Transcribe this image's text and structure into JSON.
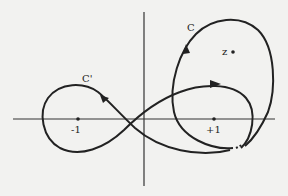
{
  "diagram": {
    "type": "contour-diagram",
    "colors": {
      "background": "#f2f2f0",
      "ink": "#222222"
    },
    "axes": {
      "horizontal": {
        "x1": 13,
        "x2": 275,
        "y": 119
      },
      "vertical": {
        "x": 144,
        "y1": 12,
        "y2": 186
      }
    },
    "labels": {
      "contour_c": "C",
      "contour_c_prime": "C'",
      "point_z": "z",
      "tick_minus_one": "-1",
      "tick_plus_one": "+1"
    },
    "points": {
      "minus_one": {
        "x": 78,
        "y": 119
      },
      "plus_one": {
        "x": 214,
        "y": 119
      },
      "z": {
        "x": 233,
        "y": 52
      }
    }
  }
}
